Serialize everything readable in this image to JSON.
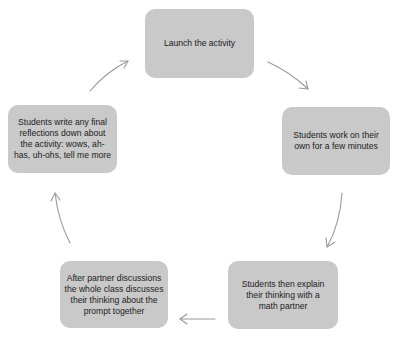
{
  "diagram": {
    "type": "cycle",
    "colors": {
      "box_fill": "#c9c9c9",
      "text": "#1c1c1c",
      "arrow": "#9a9a9a",
      "background": "#ffffff"
    },
    "steps": [
      {
        "id": 1,
        "text": "Launch the activity"
      },
      {
        "id": 2,
        "text": "Students work on their own for a few minutes"
      },
      {
        "id": 3,
        "text": "Students then explain their thinking with  a math partner"
      },
      {
        "id": 4,
        "text": "After partner discussions the whole class discusses their thinking about the prompt together"
      },
      {
        "id": 5,
        "text": "Students write any final reflections down  about the activity:  wows, ah-has, uh-ohs, tell me more"
      }
    ],
    "arrows": [
      {
        "from": 1,
        "to": 2
      },
      {
        "from": 2,
        "to": 3
      },
      {
        "from": 3,
        "to": 4
      },
      {
        "from": 4,
        "to": 5
      },
      {
        "from": 5,
        "to": 1
      }
    ]
  }
}
